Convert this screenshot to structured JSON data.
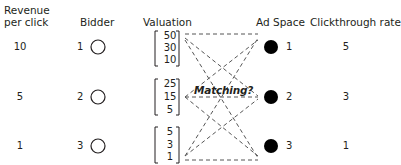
{
  "headers": {
    "revenue_line1": "Revenue",
    "revenue_line2": "per click",
    "bidder": "Bidder",
    "valuation": "Valuation",
    "ad_space": "Ad Space",
    "clickthrough": "Clickthrough rate"
  },
  "rows": [
    {
      "revenue": "10",
      "bidder": "1",
      "valuation": [
        "50",
        "30",
        "10"
      ],
      "ad_space": "1",
      "clickthrough": "5"
    },
    {
      "revenue": "5",
      "bidder": "2",
      "valuation": [
        "25",
        "15",
        "5"
      ],
      "ad_space": "2",
      "clickthrough": "3"
    },
    {
      "revenue": "1",
      "bidder": "3",
      "valuation": [
        "5",
        "3",
        "1"
      ],
      "ad_space": "3",
      "clickthrough": "1"
    }
  ],
  "center_label": "Matching?",
  "icons": {
    "bidder_node": "hollow-circle",
    "ad_space_node": "filled-circle"
  },
  "colors": {
    "ink": "#231f20",
    "dash": "#555555",
    "background": "#ffffff"
  }
}
